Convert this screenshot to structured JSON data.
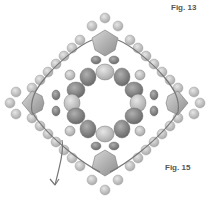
{
  "figure": {
    "type": "beadwork-pattern-diagram",
    "labels": {
      "top": "Fig. 13",
      "bottom": "Fig. 15"
    },
    "colors": {
      "light_bead": "#c8c8c8",
      "mid_bead": "#9a9a9a",
      "dark_bead": "#7d7d7d",
      "thread": "#333333",
      "thread_path": "#777777",
      "background": "#ffffff"
    }
  }
}
